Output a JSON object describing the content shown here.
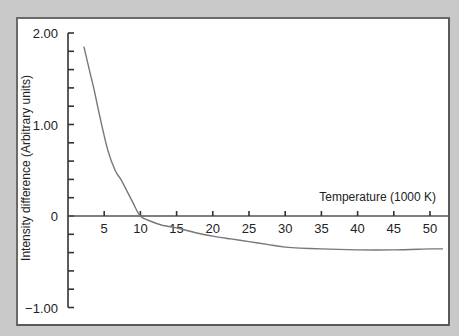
{
  "chart_data": {
    "type": "line",
    "title": "",
    "xlabel": "Temperature (1000 K)",
    "ylabel": "Intensity difference (Arbitrary units)",
    "xlim": [
      0,
      52
    ],
    "ylim": [
      -1.0,
      2.0
    ],
    "x_ticks": [
      5,
      10,
      15,
      20,
      25,
      30,
      35,
      40,
      45,
      50
    ],
    "x_tick_labels": [
      "5",
      "10",
      "15",
      "20",
      "25",
      "30",
      "35",
      "40",
      "45",
      "50"
    ],
    "y_major_ticks": [
      2.0,
      1.0,
      0,
      -1.0
    ],
    "y_tick_labels": [
      "2.00",
      "1.00",
      "0",
      "−1.00"
    ],
    "y_minor_step": 0.2,
    "grid": false,
    "legend": "none",
    "series": [
      {
        "name": "Intensity difference",
        "color": "#777777",
        "x": [
          2.2,
          3.0,
          3.6,
          4.5,
          5.5,
          6.5,
          7.3,
          8.1,
          9.0,
          10.0,
          11.5,
          13.0,
          15.0,
          17.5,
          20.0,
          22.5,
          25.0,
          27.5,
          30.0,
          35.0,
          40.0,
          45.0,
          50.0,
          51.8
        ],
        "y": [
          1.85,
          1.58,
          1.38,
          1.05,
          0.72,
          0.5,
          0.4,
          0.28,
          0.14,
          0.0,
          -0.06,
          -0.1,
          -0.13,
          -0.18,
          -0.22,
          -0.25,
          -0.28,
          -0.31,
          -0.34,
          -0.36,
          -0.37,
          -0.37,
          -0.36,
          -0.36
        ]
      }
    ]
  }
}
